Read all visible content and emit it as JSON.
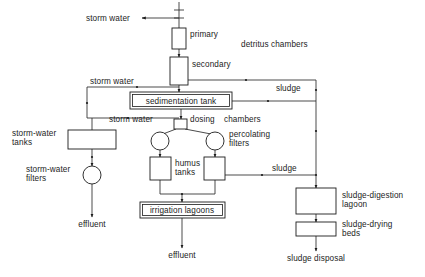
{
  "diagram": {
    "background": "#ffffff",
    "line_color": "#2a2a2a",
    "text_color": "#1c1c1c",
    "nodes": [
      {
        "id": "primary",
        "label": "primary",
        "shape": "rect",
        "x": 172,
        "y": 28,
        "w": 14,
        "h": 21
      },
      {
        "id": "secondary",
        "label": "secondary",
        "shape": "rect",
        "x": 170,
        "y": 57,
        "w": 18,
        "h": 28
      },
      {
        "id": "sedimentation-tank",
        "label": "sedimentation tank",
        "shape": "double",
        "x": 130,
        "y": 92,
        "w": 102,
        "h": 17
      },
      {
        "id": "dosing-chamber",
        "label": "dosing",
        "shape": "rect",
        "x": 174,
        "y": 119,
        "w": 13,
        "h": 10
      },
      {
        "id": "percolating-filter-l",
        "label": "",
        "shape": "circle",
        "cx": 160,
        "cy": 141,
        "r": 9
      },
      {
        "id": "percolating-filter-r",
        "label": "percolating filters",
        "shape": "circle",
        "cx": 215,
        "cy": 141,
        "r": 9
      },
      {
        "id": "humus-tank-l",
        "label": "",
        "shape": "rect",
        "x": 150,
        "y": 157,
        "w": 21,
        "h": 23
      },
      {
        "id": "humus-tank-r",
        "label": "humus tanks",
        "shape": "rect",
        "x": 204,
        "y": 157,
        "w": 21,
        "h": 23
      },
      {
        "id": "irrigation-lagoons",
        "label": "irrigation  lagoons",
        "shape": "double",
        "x": 140,
        "y": 202,
        "w": 85,
        "h": 16
      },
      {
        "id": "storm-water-tanks",
        "label": "storm-water tanks",
        "shape": "rect",
        "x": 68,
        "y": 130,
        "w": 48,
        "h": 19
      },
      {
        "id": "storm-water-filters",
        "label": "storm-water filters",
        "shape": "circle",
        "cx": 92,
        "cy": 175,
        "r": 9
      },
      {
        "id": "sludge-digestion",
        "label": "sludge-digestion lagoon",
        "shape": "rect",
        "x": 296,
        "y": 188,
        "w": 40,
        "h": 26
      },
      {
        "id": "sludge-drying-beds",
        "label": "sludge-drying beds",
        "shape": "rect",
        "x": 296,
        "y": 222,
        "w": 40,
        "h": 14
      }
    ],
    "labels": [
      {
        "id": "storm-water-top",
        "text": "storm water",
        "x": 86,
        "y": 21,
        "anchor": "start"
      },
      {
        "id": "primary-label",
        "text": "primary",
        "x": 190,
        "y": 37,
        "anchor": "start"
      },
      {
        "id": "secondary-label",
        "text": "secondary",
        "x": 192,
        "y": 67,
        "anchor": "start"
      },
      {
        "id": "detritus-chambers",
        "text": "detritus chambers",
        "x": 241,
        "y": 47,
        "anchor": "start"
      },
      {
        "id": "storm-water-mid",
        "text": "storm water",
        "x": 90,
        "y": 84,
        "anchor": "start"
      },
      {
        "id": "sludge-upper",
        "text": "sludge",
        "x": 276,
        "y": 91,
        "anchor": "start"
      },
      {
        "id": "sedimentation-label",
        "text": "sedimentation tank",
        "x": 181,
        "y": 104,
        "anchor": "middle"
      },
      {
        "id": "storm-water-lower",
        "text": "storm water",
        "x": 109,
        "y": 122,
        "anchor": "start"
      },
      {
        "id": "dosing-label",
        "text": "dosing",
        "x": 190,
        "y": 122,
        "anchor": "start"
      },
      {
        "id": "chambers-label",
        "text": "chambers",
        "x": 224,
        "y": 122,
        "anchor": "start"
      },
      {
        "id": "percolating-label",
        "text": "percolating",
        "x": 229,
        "y": 137,
        "anchor": "start"
      },
      {
        "id": "filters-label",
        "text": "filters",
        "x": 229,
        "y": 146,
        "anchor": "start"
      },
      {
        "id": "storm-water-tanks-l1",
        "text": "storm-water",
        "x": 12,
        "y": 136,
        "anchor": "start"
      },
      {
        "id": "storm-water-tanks-l2",
        "text": "tanks",
        "x": 12,
        "y": 145,
        "anchor": "start"
      },
      {
        "id": "humus-label",
        "text": "humus",
        "x": 175,
        "y": 166,
        "anchor": "start"
      },
      {
        "id": "tanks-label",
        "text": "tanks",
        "x": 175,
        "y": 175,
        "anchor": "start"
      },
      {
        "id": "storm-water-filt-l1",
        "text": "storm-water",
        "x": 26,
        "y": 172,
        "anchor": "start"
      },
      {
        "id": "storm-water-filt-l2",
        "text": "filters",
        "x": 26,
        "y": 181,
        "anchor": "start"
      },
      {
        "id": "sludge-lower",
        "text": "sludge",
        "x": 272,
        "y": 171,
        "anchor": "start"
      },
      {
        "id": "sludge-digest-l1",
        "text": "sludge-digestion",
        "x": 342,
        "y": 198,
        "anchor": "start"
      },
      {
        "id": "sludge-digest-l2",
        "text": "lagoon",
        "x": 342,
        "y": 207,
        "anchor": "start"
      },
      {
        "id": "irrigation-label",
        "text": "irrigation  lagoons",
        "x": 182,
        "y": 213,
        "anchor": "middle"
      },
      {
        "id": "sludge-dry-l1",
        "text": "sludge-drying",
        "x": 342,
        "y": 227,
        "anchor": "start"
      },
      {
        "id": "sludge-dry-l2",
        "text": "beds",
        "x": 342,
        "y": 236,
        "anchor": "start"
      },
      {
        "id": "effluent-left",
        "text": "effluent",
        "x": 92,
        "y": 227,
        "anchor": "middle"
      },
      {
        "id": "effluent-center",
        "text": "effluent",
        "x": 182,
        "y": 258,
        "anchor": "middle"
      },
      {
        "id": "sludge-disposal",
        "text": "sludge disposal",
        "x": 316,
        "y": 261,
        "anchor": "middle"
      }
    ]
  }
}
